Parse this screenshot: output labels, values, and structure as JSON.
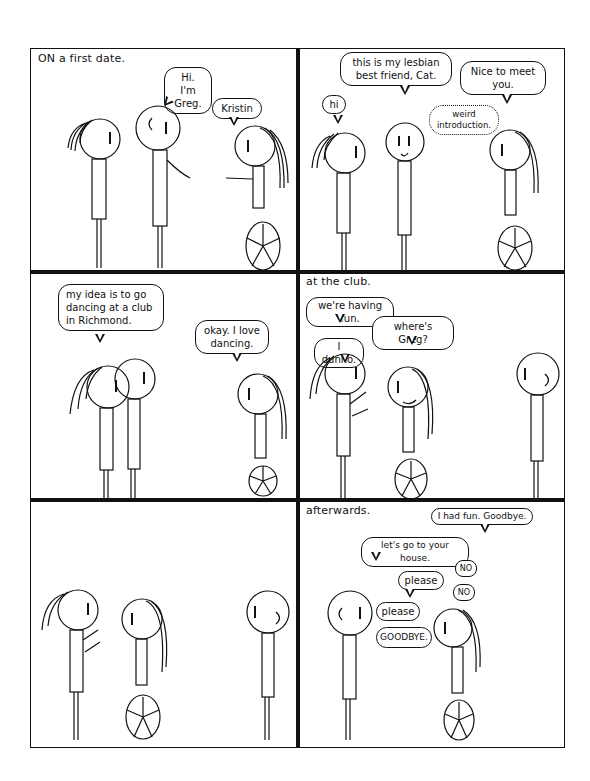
{
  "comic": {
    "panels": [
      {
        "caption": "ON a first date.",
        "bubbles": [
          {
            "speaker": "Greg",
            "text": "Hi. I'm Greg."
          },
          {
            "speaker": "Kristin",
            "text": "Kristin"
          }
        ]
      },
      {
        "caption": "",
        "bubbles": [
          {
            "speaker": "Cat",
            "text": "hi"
          },
          {
            "speaker": "Greg",
            "text": "this is my lesbian best friend, Cat."
          },
          {
            "speaker": "Kristin",
            "text": "Nice to meet you."
          },
          {
            "speaker": "Kristin",
            "type": "thought",
            "text": "weird introduction."
          }
        ]
      },
      {
        "caption": "",
        "bubbles": [
          {
            "speaker": "Greg",
            "text": "my idea is to go dancing at a club in Richmond."
          },
          {
            "speaker": "Kristin",
            "text": "okay. I love dancing."
          }
        ]
      },
      {
        "caption": "at the club.",
        "bubbles": [
          {
            "speaker": "Cat",
            "text": "we're having fun."
          },
          {
            "speaker": "Kristin",
            "text": "where's Greg?"
          },
          {
            "speaker": "Cat",
            "text": "I dunno."
          }
        ]
      },
      {
        "caption": "",
        "bubbles": []
      },
      {
        "caption": "afterwards.",
        "bubbles": [
          {
            "speaker": "Kristin",
            "text": "I had fun. Goodbye."
          },
          {
            "speaker": "Greg",
            "text": "let's go to your house."
          },
          {
            "speaker": "Kristin",
            "text": "NO"
          },
          {
            "speaker": "Greg",
            "text": "please"
          },
          {
            "speaker": "Kristin",
            "text": "NO"
          },
          {
            "speaker": "Greg",
            "text": "please"
          },
          {
            "speaker": "Kristin",
            "text": "GOODBYE."
          }
        ]
      }
    ]
  }
}
